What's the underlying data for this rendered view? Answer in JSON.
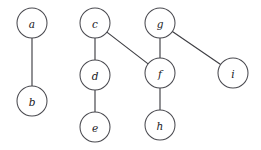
{
  "diagram": {
    "type": "undirected-graph-forest",
    "background_color": "#ffffff",
    "node_fill": "#ffffff",
    "node_stroke": "#4a4a50",
    "edge_color": "#3f3f44",
    "node_radius": 15,
    "label_style": "italic-serif",
    "nodes": [
      {
        "id": "a",
        "label": "a",
        "cx": 32,
        "cy": 23
      },
      {
        "id": "b",
        "label": "b",
        "cx": 32,
        "cy": 101
      },
      {
        "id": "c",
        "label": "c",
        "cx": 95,
        "cy": 23
      },
      {
        "id": "d",
        "label": "d",
        "cx": 95,
        "cy": 75
      },
      {
        "id": "e",
        "label": "e",
        "cx": 95,
        "cy": 127
      },
      {
        "id": "f",
        "label": "f",
        "cx": 160,
        "cy": 73
      },
      {
        "id": "g",
        "label": "g",
        "cx": 160,
        "cy": 23
      },
      {
        "id": "h",
        "label": "h",
        "cx": 160,
        "cy": 125
      },
      {
        "id": "i",
        "label": "i",
        "cx": 233,
        "cy": 73
      }
    ],
    "edges": [
      {
        "id": "a-b",
        "from": "a",
        "to": "b"
      },
      {
        "id": "c-d",
        "from": "c",
        "to": "d"
      },
      {
        "id": "d-e",
        "from": "d",
        "to": "e"
      },
      {
        "id": "c-f",
        "from": "c",
        "to": "f"
      },
      {
        "id": "g-f",
        "from": "g",
        "to": "f"
      },
      {
        "id": "g-i",
        "from": "g",
        "to": "i"
      },
      {
        "id": "f-h",
        "from": "f",
        "to": "h"
      }
    ],
    "components": [
      [
        "a",
        "b"
      ],
      [
        "c",
        "d",
        "e",
        "f",
        "g",
        "h",
        "i"
      ]
    ]
  }
}
